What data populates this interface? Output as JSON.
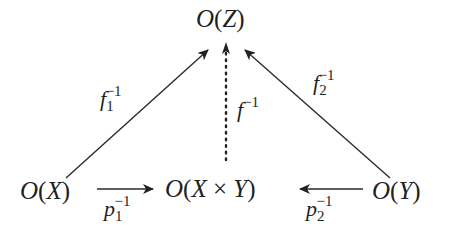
{
  "diagram": {
    "type": "commutative-diagram",
    "nodes": [
      {
        "id": "OZ",
        "label": "O(Z)",
        "pos": "top-center"
      },
      {
        "id": "OX",
        "label": "O(X)",
        "pos": "bottom-left"
      },
      {
        "id": "OXY",
        "label": "O(X × Y)",
        "pos": "bottom-center"
      },
      {
        "id": "OY",
        "label": "O(Y)",
        "pos": "bottom-right"
      }
    ],
    "edges": [
      {
        "from": "OX",
        "to": "OZ",
        "label": "f_1^{-1}",
        "style": "solid"
      },
      {
        "from": "OY",
        "to": "OZ",
        "label": "f_2^{-1}",
        "style": "solid"
      },
      {
        "from": "OXY",
        "to": "OZ",
        "label": "f^{-1}",
        "style": "dotted"
      },
      {
        "from": "OX",
        "to": "OXY",
        "label": "p_1^{-1}",
        "style": "solid"
      },
      {
        "from": "OY",
        "to": "OXY",
        "label": "p_2^{-1}",
        "style": "solid"
      }
    ],
    "text": {
      "O": "O",
      "Z": "Z",
      "X": "X",
      "Y": "Y",
      "times": "×",
      "lp": "(",
      "rp": ")",
      "f": "f",
      "p": "p",
      "sub1": "1",
      "sub2": "2",
      "inv": "−1"
    }
  }
}
